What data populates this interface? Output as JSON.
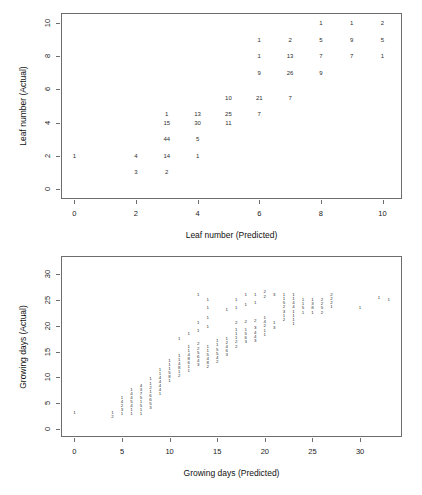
{
  "figures": [
    {
      "id": "leaf",
      "xlabel": "Leaf number (Predicted)",
      "ylabel": "Leaf number (Actual)",
      "xticks": [
        "0",
        "2",
        "4",
        "6",
        "8",
        "10"
      ],
      "yticks": [
        "0",
        "2",
        "4",
        "6",
        "8",
        "10"
      ]
    },
    {
      "id": "days",
      "xlabel": "Growing days (Predicted)",
      "ylabel": "Growing days (Actual)",
      "xticks": [
        "0",
        "5",
        "10",
        "15",
        "20",
        "25",
        "30"
      ],
      "yticks": [
        "0",
        "5",
        "10",
        "15",
        "20",
        "25",
        "30"
      ]
    }
  ],
  "chart_data": [
    {
      "type": "scatter",
      "title": "",
      "subtitle": "",
      "xlabel": "Leaf number (Predicted)",
      "ylabel": "Leaf number (Actual)",
      "xlim": [
        -0.4,
        10.6
      ],
      "ylim": [
        -0.55,
        10.55
      ],
      "xticks": [
        0,
        2,
        4,
        6,
        8,
        10
      ],
      "yticks": [
        0,
        2,
        4,
        6,
        8,
        10
      ],
      "grid": false,
      "legend": null,
      "point_labels": "counts",
      "notes": "Each plotted glyph is a count of observations at that (predicted, actual) leaf-number pair.",
      "points": [
        {
          "x": 0,
          "y": 2,
          "label": "1"
        },
        {
          "x": 2,
          "y": 2,
          "label": "4"
        },
        {
          "x": 2,
          "y": 1,
          "label": "3"
        },
        {
          "x": 3,
          "y": 4.5,
          "label": "1"
        },
        {
          "x": 3,
          "y": 4,
          "label": "15"
        },
        {
          "x": 3,
          "y": 3,
          "label": "44"
        },
        {
          "x": 3,
          "y": 2,
          "label": "14"
        },
        {
          "x": 3,
          "y": 1,
          "label": "2"
        },
        {
          "x": 4,
          "y": 4.5,
          "label": "13"
        },
        {
          "x": 4,
          "y": 4,
          "label": "30"
        },
        {
          "x": 4,
          "y": 3,
          "label": "5"
        },
        {
          "x": 4,
          "y": 2,
          "label": "1"
        },
        {
          "x": 5,
          "y": 5.5,
          "label": "10"
        },
        {
          "x": 5,
          "y": 4.5,
          "label": "25"
        },
        {
          "x": 5,
          "y": 4,
          "label": "11"
        },
        {
          "x": 6,
          "y": 9,
          "label": "1"
        },
        {
          "x": 6,
          "y": 8,
          "label": "1"
        },
        {
          "x": 6,
          "y": 7,
          "label": "9"
        },
        {
          "x": 6,
          "y": 5.5,
          "label": "21"
        },
        {
          "x": 6,
          "y": 4.5,
          "label": "7"
        },
        {
          "x": 7,
          "y": 9,
          "label": "2"
        },
        {
          "x": 7,
          "y": 8,
          "label": "13"
        },
        {
          "x": 7,
          "y": 7,
          "label": "26"
        },
        {
          "x": 7,
          "y": 5.5,
          "label": "7"
        },
        {
          "x": 8,
          "y": 10,
          "label": "1"
        },
        {
          "x": 8,
          "y": 9,
          "label": "5"
        },
        {
          "x": 8,
          "y": 8,
          "label": "7"
        },
        {
          "x": 8,
          "y": 7,
          "label": "9"
        },
        {
          "x": 9,
          "y": 10,
          "label": "1"
        },
        {
          "x": 9,
          "y": 9,
          "label": "9"
        },
        {
          "x": 9,
          "y": 8,
          "label": "7"
        },
        {
          "x": 10,
          "y": 10,
          "label": "2"
        },
        {
          "x": 10,
          "y": 9,
          "label": "5"
        },
        {
          "x": 10,
          "y": 8,
          "label": "1"
        }
      ]
    },
    {
      "type": "scatter",
      "title": "",
      "subtitle": "",
      "xlabel": "Growing days (Predicted)",
      "ylabel": "Growing days (Actual)",
      "xlim": [
        -1.3,
        34.3
      ],
      "ylim": [
        -1.4,
        33.4
      ],
      "xticks": [
        0,
        5,
        10,
        15,
        20,
        25,
        30
      ],
      "yticks": [
        0,
        5,
        10,
        15,
        20,
        25,
        30
      ],
      "grid": false,
      "legend": null,
      "point_labels": "counts",
      "notes": "Dense diagonal band of small count glyphs; most counts are single digits (1-9).",
      "points": [
        {
          "x": 0,
          "y": 3,
          "label": "1"
        },
        {
          "x": 4,
          "y": 3,
          "label": "1"
        },
        {
          "x": 4,
          "y": 2.2,
          "label": "2"
        },
        {
          "x": 5,
          "y": 6,
          "label": "1"
        },
        {
          "x": 5,
          "y": 5.2,
          "label": "4"
        },
        {
          "x": 5,
          "y": 4.4,
          "label": "2"
        },
        {
          "x": 5,
          "y": 3.6,
          "label": "3"
        },
        {
          "x": 5,
          "y": 2.8,
          "label": "1"
        },
        {
          "x": 6,
          "y": 7.6,
          "label": "1"
        },
        {
          "x": 6,
          "y": 6.8,
          "label": "4"
        },
        {
          "x": 6,
          "y": 6.0,
          "label": "4"
        },
        {
          "x": 6,
          "y": 5.2,
          "label": "5"
        },
        {
          "x": 6,
          "y": 4.4,
          "label": "4"
        },
        {
          "x": 6,
          "y": 3.6,
          "label": "1"
        },
        {
          "x": 6,
          "y": 2.8,
          "label": "1"
        },
        {
          "x": 7,
          "y": 8.4,
          "label": "4"
        },
        {
          "x": 7,
          "y": 7.6,
          "label": "3"
        },
        {
          "x": 7,
          "y": 6.8,
          "label": "7"
        },
        {
          "x": 7,
          "y": 6.0,
          "label": "5"
        },
        {
          "x": 7,
          "y": 5.2,
          "label": "1"
        },
        {
          "x": 7,
          "y": 4.4,
          "label": "5"
        },
        {
          "x": 7,
          "y": 3.6,
          "label": "1"
        },
        {
          "x": 7,
          "y": 2.8,
          "label": "1"
        },
        {
          "x": 8,
          "y": 9.6,
          "label": "1"
        },
        {
          "x": 8,
          "y": 8.8,
          "label": "1"
        },
        {
          "x": 8,
          "y": 8.0,
          "label": "2"
        },
        {
          "x": 8,
          "y": 7.2,
          "label": "1"
        },
        {
          "x": 8,
          "y": 6.4,
          "label": "6"
        },
        {
          "x": 8,
          "y": 5.6,
          "label": "6"
        },
        {
          "x": 8,
          "y": 4.8,
          "label": "5"
        },
        {
          "x": 8,
          "y": 4.0,
          "label": "3"
        },
        {
          "x": 9,
          "y": 11.5,
          "label": "1"
        },
        {
          "x": 9,
          "y": 10.7,
          "label": "1"
        },
        {
          "x": 9,
          "y": 9.9,
          "label": "4"
        },
        {
          "x": 9,
          "y": 9.1,
          "label": "4"
        },
        {
          "x": 9,
          "y": 8.3,
          "label": "4"
        },
        {
          "x": 9,
          "y": 7.5,
          "label": "4"
        },
        {
          "x": 9,
          "y": 6.7,
          "label": "1"
        },
        {
          "x": 10,
          "y": 13.2,
          "label": "1"
        },
        {
          "x": 10,
          "y": 12.4,
          "label": "1"
        },
        {
          "x": 10,
          "y": 11.6,
          "label": "1"
        },
        {
          "x": 10,
          "y": 10.8,
          "label": "5"
        },
        {
          "x": 10,
          "y": 10.0,
          "label": "8"
        },
        {
          "x": 10,
          "y": 9.2,
          "label": "1"
        },
        {
          "x": 11,
          "y": 17.5,
          "label": "1"
        },
        {
          "x": 11,
          "y": 14.2,
          "label": "1"
        },
        {
          "x": 11,
          "y": 13.4,
          "label": "1"
        },
        {
          "x": 11,
          "y": 12.6,
          "label": "4"
        },
        {
          "x": 11,
          "y": 11.8,
          "label": "8"
        },
        {
          "x": 11,
          "y": 11.0,
          "label": "1"
        },
        {
          "x": 11,
          "y": 10.2,
          "label": "2"
        },
        {
          "x": 12,
          "y": 18.5,
          "label": "1"
        },
        {
          "x": 12,
          "y": 16.0,
          "label": "1"
        },
        {
          "x": 12,
          "y": 15.2,
          "label": "1"
        },
        {
          "x": 12,
          "y": 14.4,
          "label": "4"
        },
        {
          "x": 12,
          "y": 13.6,
          "label": "8"
        },
        {
          "x": 12,
          "y": 12.8,
          "label": "6"
        },
        {
          "x": 12,
          "y": 12.0,
          "label": "1"
        },
        {
          "x": 12,
          "y": 11.2,
          "label": "1"
        },
        {
          "x": 13,
          "y": 26.0,
          "label": "1"
        },
        {
          "x": 13,
          "y": 20.5,
          "label": "1"
        },
        {
          "x": 13,
          "y": 19.0,
          "label": "1"
        },
        {
          "x": 13,
          "y": 16.4,
          "label": "2"
        },
        {
          "x": 13,
          "y": 15.6,
          "label": "2"
        },
        {
          "x": 13,
          "y": 14.8,
          "label": "5"
        },
        {
          "x": 13,
          "y": 14.0,
          "label": "6"
        },
        {
          "x": 13,
          "y": 13.2,
          "label": "4"
        },
        {
          "x": 13,
          "y": 12.4,
          "label": "3"
        },
        {
          "x": 14,
          "y": 25.0,
          "label": "1"
        },
        {
          "x": 14,
          "y": 23.5,
          "label": "1"
        },
        {
          "x": 14,
          "y": 21.5,
          "label": "1"
        },
        {
          "x": 14,
          "y": 19.8,
          "label": "1"
        },
        {
          "x": 14,
          "y": 16.0,
          "label": "1"
        },
        {
          "x": 14,
          "y": 15.2,
          "label": "1"
        },
        {
          "x": 14,
          "y": 14.4,
          "label": "5"
        },
        {
          "x": 14,
          "y": 13.6,
          "label": "4"
        },
        {
          "x": 14,
          "y": 12.8,
          "label": "8"
        },
        {
          "x": 14,
          "y": 12.0,
          "label": "2"
        },
        {
          "x": 15,
          "y": 17.0,
          "label": "1"
        },
        {
          "x": 15,
          "y": 16.2,
          "label": "1"
        },
        {
          "x": 15,
          "y": 15.4,
          "label": "5"
        },
        {
          "x": 15,
          "y": 14.6,
          "label": "5"
        },
        {
          "x": 15,
          "y": 13.8,
          "label": "4"
        },
        {
          "x": 15,
          "y": 13.0,
          "label": "2"
        },
        {
          "x": 16,
          "y": 23.0,
          "label": "1"
        },
        {
          "x": 16,
          "y": 17.5,
          "label": "1"
        },
        {
          "x": 16,
          "y": 16.7,
          "label": "2"
        },
        {
          "x": 16,
          "y": 15.9,
          "label": "4"
        },
        {
          "x": 16,
          "y": 15.1,
          "label": "6"
        },
        {
          "x": 16,
          "y": 14.3,
          "label": "3"
        },
        {
          "x": 17,
          "y": 25.0,
          "label": "1"
        },
        {
          "x": 17,
          "y": 23.5,
          "label": "1"
        },
        {
          "x": 17,
          "y": 20.5,
          "label": "2"
        },
        {
          "x": 17,
          "y": 19.2,
          "label": "1"
        },
        {
          "x": 17,
          "y": 18.4,
          "label": "1"
        },
        {
          "x": 17,
          "y": 17.6,
          "label": "1"
        },
        {
          "x": 17,
          "y": 16.8,
          "label": "2"
        },
        {
          "x": 17,
          "y": 16.0,
          "label": "2"
        },
        {
          "x": 18,
          "y": 26.0,
          "label": "1"
        },
        {
          "x": 18,
          "y": 24.0,
          "label": "1"
        },
        {
          "x": 18,
          "y": 20.8,
          "label": "2"
        },
        {
          "x": 18,
          "y": 19.2,
          "label": "1"
        },
        {
          "x": 18,
          "y": 18.4,
          "label": "5"
        },
        {
          "x": 18,
          "y": 17.6,
          "label": "6"
        },
        {
          "x": 18,
          "y": 16.8,
          "label": "3"
        },
        {
          "x": 19,
          "y": 26.0,
          "label": "1"
        },
        {
          "x": 19,
          "y": 24.5,
          "label": "1"
        },
        {
          "x": 19,
          "y": 21.0,
          "label": "2"
        },
        {
          "x": 19,
          "y": 19.5,
          "label": "3"
        },
        {
          "x": 19,
          "y": 18.7,
          "label": "4"
        },
        {
          "x": 19,
          "y": 17.9,
          "label": "4"
        },
        {
          "x": 19,
          "y": 17.1,
          "label": "3"
        },
        {
          "x": 20,
          "y": 26.5,
          "label": "2"
        },
        {
          "x": 20,
          "y": 25.7,
          "label": "2"
        },
        {
          "x": 20,
          "y": 21.5,
          "label": "1"
        },
        {
          "x": 20,
          "y": 20.7,
          "label": "4"
        },
        {
          "x": 20,
          "y": 19.9,
          "label": "2"
        },
        {
          "x": 20,
          "y": 19.1,
          "label": "1"
        },
        {
          "x": 20,
          "y": 18.3,
          "label": "1"
        },
        {
          "x": 21,
          "y": 26.0,
          "label": "3"
        },
        {
          "x": 21,
          "y": 20.5,
          "label": "1"
        },
        {
          "x": 21,
          "y": 19.5,
          "label": "3"
        },
        {
          "x": 22,
          "y": 26.0,
          "label": "1"
        },
        {
          "x": 22,
          "y": 25.2,
          "label": "1"
        },
        {
          "x": 22,
          "y": 24.4,
          "label": "5"
        },
        {
          "x": 22,
          "y": 23.6,
          "label": "2"
        },
        {
          "x": 22,
          "y": 22.8,
          "label": "3"
        },
        {
          "x": 22,
          "y": 22.0,
          "label": "1"
        },
        {
          "x": 22,
          "y": 21.2,
          "label": "2"
        },
        {
          "x": 23,
          "y": 26.0,
          "label": "1"
        },
        {
          "x": 23,
          "y": 25.2,
          "label": "1"
        },
        {
          "x": 23,
          "y": 24.4,
          "label": "4"
        },
        {
          "x": 23,
          "y": 23.6,
          "label": "4"
        },
        {
          "x": 23,
          "y": 22.8,
          "label": "1"
        },
        {
          "x": 23,
          "y": 22.0,
          "label": "1"
        },
        {
          "x": 23,
          "y": 21.2,
          "label": "1"
        },
        {
          "x": 23,
          "y": 20.4,
          "label": "1"
        },
        {
          "x": 24,
          "y": 25.0,
          "label": "1"
        },
        {
          "x": 24,
          "y": 24.2,
          "label": "1"
        },
        {
          "x": 24,
          "y": 23.4,
          "label": "5"
        },
        {
          "x": 24,
          "y": 22.6,
          "label": "1"
        },
        {
          "x": 25,
          "y": 25.0,
          "label": "1"
        },
        {
          "x": 25,
          "y": 24.2,
          "label": "3"
        },
        {
          "x": 25,
          "y": 23.4,
          "label": "8"
        },
        {
          "x": 25,
          "y": 22.6,
          "label": "1"
        },
        {
          "x": 26,
          "y": 25.0,
          "label": "2"
        },
        {
          "x": 26,
          "y": 24.2,
          "label": "2"
        },
        {
          "x": 26,
          "y": 23.4,
          "label": "5"
        },
        {
          "x": 26,
          "y": 22.6,
          "label": "2"
        },
        {
          "x": 27,
          "y": 26.0,
          "label": "2"
        },
        {
          "x": 27,
          "y": 25.2,
          "label": "2"
        },
        {
          "x": 27,
          "y": 24.4,
          "label": "2"
        },
        {
          "x": 27,
          "y": 23.6,
          "label": "1"
        },
        {
          "x": 30,
          "y": 23.5,
          "label": "1"
        },
        {
          "x": 32,
          "y": 25.5,
          "label": "1"
        },
        {
          "x": 33,
          "y": 25.0,
          "label": "1"
        }
      ]
    }
  ]
}
